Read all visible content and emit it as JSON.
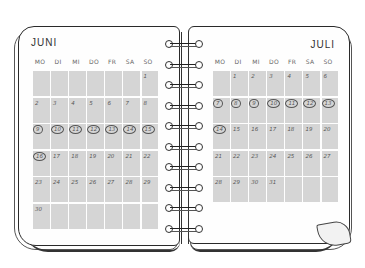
{
  "calendar": {
    "left_page": {
      "month": "JUNI",
      "weekdays": [
        "MO",
        "DI",
        "MI",
        "DO",
        "FR",
        "SA",
        "SO"
      ],
      "weeks": [
        [
          "",
          "",
          "",
          "",
          "",
          "",
          "1"
        ],
        [
          "2",
          "3",
          "4",
          "5",
          "6",
          "7",
          "8"
        ],
        [
          "9",
          "10",
          "11",
          "12",
          "13",
          "14",
          "15"
        ],
        [
          "16",
          "17",
          "18",
          "19",
          "20",
          "21",
          "22"
        ],
        [
          "23",
          "24",
          "25",
          "26",
          "27",
          "28",
          "29"
        ],
        [
          "30",
          "",
          "",
          "",
          "",
          "",
          ""
        ]
      ],
      "circled": [
        "9",
        "10",
        "11",
        "12",
        "13",
        "14",
        "15",
        "16"
      ]
    },
    "right_page": {
      "month": "JULI",
      "weekdays": [
        "MO",
        "DI",
        "MI",
        "DO",
        "FR",
        "SA",
        "SO"
      ],
      "weeks": [
        [
          "",
          "1",
          "2",
          "3",
          "4",
          "5",
          "6"
        ],
        [
          "7",
          "8",
          "9",
          "10",
          "11",
          "12",
          "13"
        ],
        [
          "14",
          "15",
          "16",
          "17",
          "18",
          "19",
          "20"
        ],
        [
          "21",
          "22",
          "23",
          "24",
          "25",
          "26",
          "27"
        ],
        [
          "28",
          "29",
          "30",
          "31",
          "",
          "",
          ""
        ]
      ],
      "circled": [
        "7",
        "8",
        "9",
        "10",
        "11",
        "12",
        "13",
        "14"
      ]
    },
    "spiral_rings": 10,
    "colors": {
      "cell": "#d5d5d5",
      "ink": "#333333",
      "paper": "#fefefe"
    }
  }
}
